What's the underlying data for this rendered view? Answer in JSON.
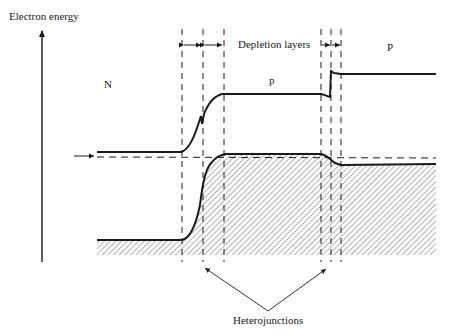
{
  "diagram": {
    "y_axis_label": "Electron energy",
    "region_labels": {
      "left": "N",
      "middle": "p",
      "right": "P"
    },
    "depletion_label": "Depletion layers",
    "junction_label": "Heterojunctions",
    "colors": {
      "line": "#1a1a1a",
      "hatch": "#555555",
      "background": "#ffffff"
    }
  }
}
